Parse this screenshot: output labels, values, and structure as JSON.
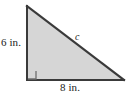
{
  "figure": {
    "type": "right-triangle-diagram",
    "background_color": "#ffffff",
    "fill_color": "#d6d6d6",
    "stroke_color": "#3a3a3a",
    "right_angle_marker_color": "#6e6e6e",
    "labels": {
      "vertical_leg": "6 in.",
      "horizontal_leg": "8 in.",
      "hypotenuse": "c"
    },
    "geometry": {
      "top_vertex": [
        27,
        6
      ],
      "right_angle_vertex": [
        27,
        80
      ],
      "right_vertex": [
        124,
        80
      ],
      "vertical_leg_length_in": 6,
      "horizontal_leg_length_in": 8,
      "right_angle_marker_size_px": 9
    }
  }
}
